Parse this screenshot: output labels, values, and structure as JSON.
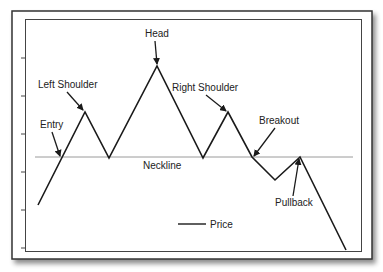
{
  "chart_data": {
    "type": "line",
    "title": "",
    "xlabel": "",
    "ylabel": "",
    "grid": false,
    "legend": {
      "position": "bottom-center",
      "entries": [
        "Price"
      ]
    },
    "series": [
      {
        "name": "Price",
        "points": [
          {
            "x": 38,
            "y": 205
          },
          {
            "x": 85,
            "y": 112
          },
          {
            "x": 109,
            "y": 158
          },
          {
            "x": 157,
            "y": 66
          },
          {
            "x": 203,
            "y": 158
          },
          {
            "x": 228,
            "y": 112
          },
          {
            "x": 252,
            "y": 157
          },
          {
            "x": 275,
            "y": 180
          },
          {
            "x": 300,
            "y": 157
          },
          {
            "x": 346,
            "y": 250
          }
        ]
      }
    ],
    "reference_lines": [
      {
        "name": "Neckline",
        "y": 157,
        "x_start": 35,
        "x_end": 353
      }
    ],
    "annotations": [
      {
        "text": "Head",
        "label_x": 145,
        "label_y": 37,
        "arrow_to": [
          157,
          64
        ]
      },
      {
        "text": "Left Shoulder",
        "label_x": 38,
        "label_y": 88,
        "arrow_to": [
          83,
          110
        ]
      },
      {
        "text": "Right Shoulder",
        "label_x": 172,
        "label_y": 91,
        "arrow_to": [
          226,
          111
        ]
      },
      {
        "text": "Entry",
        "label_x": 40,
        "label_y": 128,
        "arrow_to": [
          60,
          156
        ]
      },
      {
        "text": "Breakout",
        "label_x": 259,
        "label_y": 124,
        "arrow_to": [
          254,
          156
        ]
      },
      {
        "text": "Pullback",
        "label_x": 275,
        "label_y": 206,
        "arrow_to": [
          299,
          159
        ]
      },
      {
        "text": "Neckline",
        "label_x": 143,
        "label_y": 168,
        "arrow_to": null
      }
    ],
    "y_ticks": [
      58,
      96,
      134,
      172,
      210,
      248
    ]
  },
  "labels": {
    "head": "Head",
    "left_shoulder": "Left Shoulder",
    "right_shoulder": "Right Shoulder",
    "entry": "Entry",
    "breakout": "Breakout",
    "pullback": "Pullback",
    "neckline": "Neckline",
    "legend_price": "Price"
  },
  "colors": {
    "line": "#1a1a1a",
    "neckline": "#9a9a9a",
    "frame": "#333333",
    "text": "#222222"
  }
}
